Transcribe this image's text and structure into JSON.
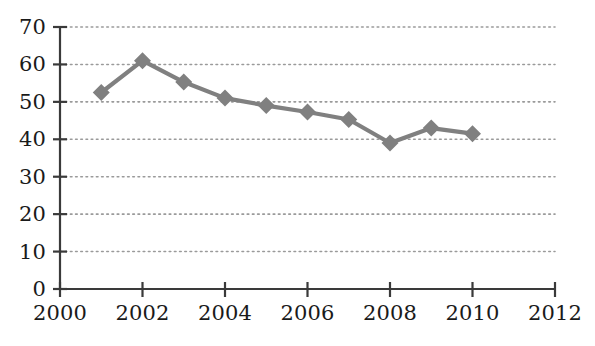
{
  "chart_data": {
    "type": "line",
    "title": "",
    "subtitle": "",
    "xlabel": "",
    "ylabel": "",
    "x": [
      2001,
      2002,
      2003,
      2004,
      2005,
      2006,
      2007,
      2008,
      2009,
      2010
    ],
    "values": [
      52.5,
      61.0,
      55.3,
      51.0,
      49.0,
      47.3,
      45.3,
      39.0,
      43.0,
      41.5
    ],
    "series": [
      {
        "name": "series-1",
        "x": [
          2001,
          2002,
          2003,
          2004,
          2005,
          2006,
          2007,
          2008,
          2009,
          2010
        ],
        "values": [
          52.5,
          61.0,
          55.3,
          51.0,
          49.0,
          47.3,
          45.3,
          39.0,
          43.0,
          41.5
        ],
        "color": "#808080",
        "marker": "diamond"
      }
    ],
    "xlim": [
      2000,
      2012
    ],
    "ylim": [
      0,
      70
    ],
    "xticks": [
      2000,
      2002,
      2004,
      2006,
      2008,
      2010,
      2012
    ],
    "xtick_labels": [
      "2000",
      "2002",
      "2004",
      "2006",
      "2008",
      "2010",
      "2012"
    ],
    "yticks": [
      0,
      10,
      20,
      30,
      40,
      50,
      60,
      70
    ],
    "ytick_labels": [
      "0",
      "10",
      "20",
      "30",
      "40",
      "50",
      "60",
      "70"
    ],
    "grid": {
      "horizontal": true,
      "vertical": false,
      "style": "dotted",
      "color": "#9a9a9a"
    },
    "legend": {
      "visible": false,
      "position": "none",
      "entries": []
    },
    "annotations": [],
    "axis_color": "#3a3a3a",
    "text_color": "#1a1a1a",
    "background_color": "#ffffff"
  }
}
